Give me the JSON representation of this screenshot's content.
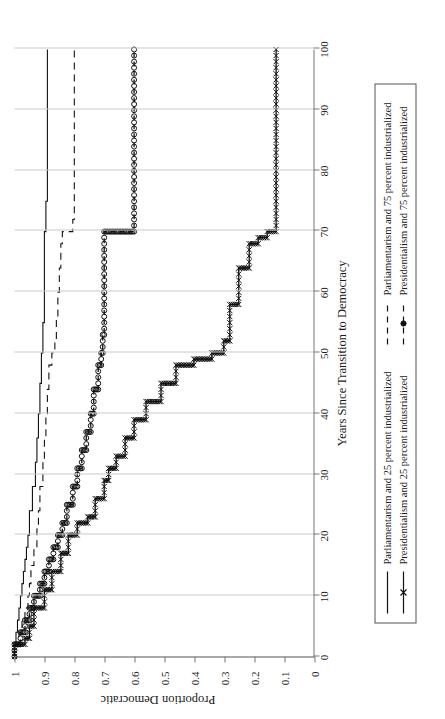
{
  "figure": {
    "xtitle": "Years Since Transition to Democracy",
    "ytitle": "Proportion Democratic"
  },
  "legend": {
    "items": [
      {
        "label": "Parliamentarism and 25 percent industrialized",
        "marker": "solid-line-icon"
      },
      {
        "label": "Parliamentarism and 75 percent industrialized",
        "marker": "dashed-line-icon"
      },
      {
        "label": "Presidentialism and 25 percent industrialized",
        "marker": "solid-line-x-marker-icon"
      },
      {
        "label": "Presidentialism and 75 percent industrialized",
        "marker": "dashed-line-circle-marker-icon"
      }
    ]
  },
  "chart_data": {
    "type": "line",
    "title": "",
    "xlabel": "Years Since Transition to Democracy",
    "ylabel": "Proportion Democratic",
    "xlim": [
      0,
      100
    ],
    "ylim": [
      0,
      1
    ],
    "xticks": [
      0,
      10,
      20,
      30,
      40,
      50,
      60,
      70,
      80,
      90,
      100
    ],
    "yticks": [
      0,
      0.1,
      0.2,
      0.3,
      0.4,
      0.5,
      0.6,
      0.7,
      0.8,
      0.9,
      1
    ],
    "xtick_labels": [
      "0",
      "10",
      "20",
      "30",
      "40",
      "50",
      "60",
      "70",
      "80",
      "90",
      "100"
    ],
    "ytick_labels": [
      "0",
      "0.1",
      "0.2",
      "0.3",
      "0.4",
      "0.5",
      "0.6",
      "0.7",
      "0.8",
      "0.9",
      "1"
    ],
    "grid": "vertical",
    "legend_position": "below-axes",
    "series": [
      {
        "name": "Parliamentarism and 25 percent industrialized",
        "style": "solid",
        "marker": "none",
        "x": [
          0,
          2,
          4,
          6,
          8,
          10,
          12,
          14,
          16,
          18,
          20,
          24,
          28,
          32,
          36,
          40,
          45,
          50,
          55,
          60,
          65,
          70,
          75,
          80,
          90,
          100
        ],
        "y": [
          1.0,
          0.995,
          0.99,
          0.985,
          0.98,
          0.975,
          0.97,
          0.965,
          0.96,
          0.955,
          0.95,
          0.94,
          0.93,
          0.925,
          0.92,
          0.915,
          0.91,
          0.905,
          0.9,
          0.9,
          0.9,
          0.895,
          0.89,
          0.89,
          0.89,
          0.89
        ]
      },
      {
        "name": "Parliamentarism and 75 percent industrialized",
        "style": "dashed",
        "marker": "none",
        "x": [
          0,
          2,
          4,
          6,
          8,
          10,
          12,
          15,
          18,
          21,
          24,
          28,
          32,
          36,
          40,
          44,
          48,
          50,
          52,
          56,
          60,
          64,
          68,
          70,
          72,
          80,
          90,
          100
        ],
        "y": [
          1.0,
          0.985,
          0.975,
          0.965,
          0.955,
          0.95,
          0.945,
          0.935,
          0.925,
          0.92,
          0.915,
          0.905,
          0.9,
          0.895,
          0.89,
          0.885,
          0.875,
          0.865,
          0.86,
          0.855,
          0.85,
          0.845,
          0.84,
          0.805,
          0.8,
          0.8,
          0.8,
          0.8
        ]
      },
      {
        "name": "Presidentialism and 25 percent industrialized",
        "style": "solid",
        "marker": "x",
        "x": [
          0,
          2,
          3,
          5,
          8,
          11,
          14,
          17,
          20,
          22,
          23,
          26,
          29,
          31,
          33,
          36,
          39,
          42,
          45,
          48,
          49,
          50,
          52,
          58,
          64,
          68,
          69,
          70,
          80,
          90,
          100
        ],
        "y": [
          1.0,
          0.965,
          0.95,
          0.935,
          0.9,
          0.875,
          0.845,
          0.82,
          0.79,
          0.755,
          0.73,
          0.7,
          0.685,
          0.66,
          0.63,
          0.6,
          0.56,
          0.51,
          0.46,
          0.4,
          0.34,
          0.3,
          0.28,
          0.25,
          0.215,
          0.185,
          0.155,
          0.125,
          0.125,
          0.125,
          0.125
        ]
      },
      {
        "name": "Presidentialism and 75 percent industrialized",
        "style": "dashed",
        "marker": "circle",
        "x": [
          0,
          2,
          4,
          6,
          8,
          10,
          12,
          14,
          16,
          18,
          20,
          22,
          25,
          28,
          31,
          34,
          37,
          40,
          44,
          48,
          50,
          53,
          57,
          61,
          65,
          68,
          69,
          70,
          75,
          80,
          90,
          100
        ],
        "y": [
          1.0,
          0.98,
          0.965,
          0.95,
          0.935,
          0.915,
          0.9,
          0.885,
          0.87,
          0.855,
          0.84,
          0.825,
          0.805,
          0.79,
          0.775,
          0.76,
          0.745,
          0.735,
          0.72,
          0.71,
          0.705,
          0.7,
          0.7,
          0.7,
          0.7,
          0.7,
          0.7,
          0.6,
          0.6,
          0.6,
          0.6,
          0.6
        ]
      }
    ]
  }
}
